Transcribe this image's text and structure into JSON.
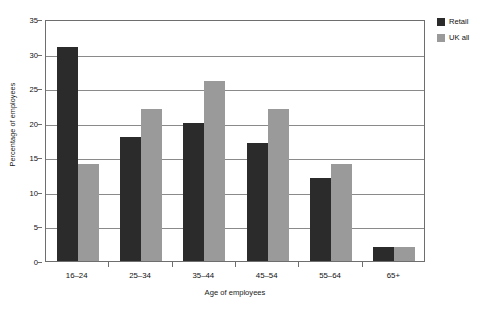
{
  "chart_data": {
    "type": "bar",
    "title": "",
    "subtitle": "",
    "categories": [
      "16–24",
      "25–34",
      "35–44",
      "45–54",
      "55–64",
      "65+"
    ],
    "series": [
      {
        "name": "Retail",
        "color": "#2b2b2b",
        "values": [
          31,
          18,
          20,
          17,
          12,
          2
        ]
      },
      {
        "name": "UK all",
        "color": "#9a9a9a",
        "values": [
          14,
          22,
          26,
          22,
          14,
          2
        ]
      }
    ],
    "xlabel": "Age of employees",
    "ylabel": "Percentage of employees",
    "ylim": [
      0,
      35
    ],
    "ytick_step": 5,
    "yticks": [
      0,
      5,
      10,
      15,
      20,
      25,
      30,
      35
    ],
    "ytick_labels": [
      "0",
      "5",
      "10",
      "15",
      "20",
      "25",
      "30",
      "35"
    ],
    "grid": "horizontal",
    "legend_position": "top-right-outside",
    "legend_entries": [
      "Retail",
      "UK all"
    ],
    "annotations": []
  },
  "colors": {
    "retail": "#2b2b2b",
    "uk_all": "#9a9a9a",
    "axis": "#6e6e6e",
    "grid": "#8a8a8a",
    "text": "#111111",
    "background": "#ffffff"
  },
  "bottom_caption": ""
}
